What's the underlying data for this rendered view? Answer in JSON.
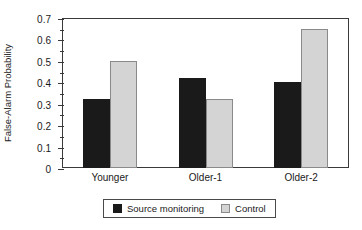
{
  "chart_data": {
    "type": "bar",
    "title": "",
    "xlabel": "",
    "ylabel": "False-Alarm Probability",
    "categories": [
      "Younger",
      "Older-1",
      "Older-2"
    ],
    "series": [
      {
        "name": "Source monitoring",
        "color": "#1a1a1a",
        "values": [
          0.32,
          0.42,
          0.4
        ]
      },
      {
        "name": "Control",
        "color": "#d4d4d4",
        "values": [
          0.5,
          0.32,
          0.65
        ]
      }
    ],
    "ylim": [
      0,
      0.7
    ],
    "ytick_labels": [
      "0",
      "0.1",
      "0.2",
      "0.3",
      "0.4",
      "0.5",
      "0.6",
      "0.7"
    ],
    "ytick_values": [
      0,
      0.1,
      0.2,
      0.3,
      0.4,
      0.5,
      0.6,
      0.7
    ],
    "yminor_tick_values": [
      0.05,
      0.15,
      0.25,
      0.35,
      0.45,
      0.55,
      0.65
    ],
    "grid": false,
    "legend_position": "bottom-center"
  }
}
